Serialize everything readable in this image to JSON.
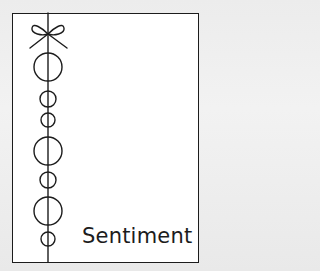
{
  "card": {
    "label": "Sentiment",
    "colors": {
      "ink": "#1c1c1c",
      "card_background": "#ffffff",
      "page_background": "#eeeeee"
    },
    "motif": {
      "type": "string-of-beads-with-bow",
      "line_x": 48,
      "bow": {
        "cx": 48,
        "cy": 34
      },
      "beads": [
        {
          "cy": 67,
          "r": 14
        },
        {
          "cy": 99,
          "r": 8
        },
        {
          "cy": 120,
          "r": 7
        },
        {
          "cy": 151,
          "r": 14
        },
        {
          "cy": 180,
          "r": 8
        },
        {
          "cy": 211,
          "r": 14
        },
        {
          "cy": 239,
          "r": 7
        }
      ]
    }
  }
}
